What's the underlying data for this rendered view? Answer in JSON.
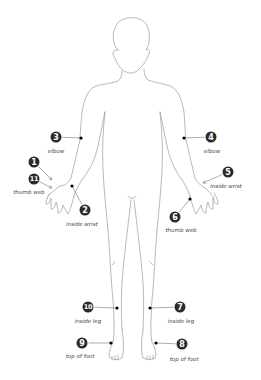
{
  "diagram": {
    "type": "body-outline-front",
    "colors": {
      "outline": "#9a9a9a",
      "marker_fill": "#2b2b2b",
      "marker_text": "#ffffff",
      "dot": "#000000",
      "label": "#444444"
    },
    "points": [
      {
        "id": "1",
        "number": "1",
        "label": "",
        "marker": [
          34,
          162
        ],
        "label_pos": [
          0,
          0
        ],
        "target": [
          52,
          180
        ],
        "connector": "arrow"
      },
      {
        "id": "11",
        "number": "11",
        "label": "thumb web",
        "marker": [
          34,
          179
        ],
        "label_pos": [
          29,
          192
        ],
        "target": [
          52,
          188
        ],
        "connector": "arrow"
      },
      {
        "id": "3",
        "number": "3",
        "label": "elbow",
        "marker": [
          56,
          137
        ],
        "label_pos": [
          56,
          151
        ],
        "target": [
          81,
          138
        ],
        "connector": "line"
      },
      {
        "id": "2",
        "number": "2",
        "label": "inside wrist",
        "marker": [
          85,
          210
        ],
        "label_pos": [
          82,
          224
        ],
        "target": [
          72,
          186
        ],
        "connector": "line"
      },
      {
        "id": "4",
        "number": "4",
        "label": "elbow",
        "marker": [
          211,
          137
        ],
        "label_pos": [
          212,
          151
        ],
        "target": [
          184,
          138
        ],
        "connector": "line"
      },
      {
        "id": "5",
        "number": "5",
        "label": "inside wrist",
        "marker": [
          228,
          172
        ],
        "label_pos": [
          226,
          186
        ],
        "target": [
          203,
          183
        ],
        "connector": "arrow"
      },
      {
        "id": "6",
        "number": "6",
        "label": "thumb web",
        "marker": [
          175,
          217
        ],
        "label_pos": [
          181,
          230
        ],
        "target": [
          190,
          199
        ],
        "connector": "line"
      },
      {
        "id": "10",
        "number": "10",
        "label": "inside leg",
        "marker": [
          88,
          307
        ],
        "label_pos": [
          88,
          321
        ],
        "target": [
          117,
          308
        ],
        "connector": "line"
      },
      {
        "id": "7",
        "number": "7",
        "label": "inside leg",
        "marker": [
          180,
          307
        ],
        "label_pos": [
          181,
          321
        ],
        "target": [
          150,
          308
        ],
        "connector": "line"
      },
      {
        "id": "9",
        "number": "9",
        "label": "top of foot",
        "marker": [
          82,
          343
        ],
        "label_pos": [
          80,
          356
        ],
        "target": [
          111,
          343
        ],
        "connector": "line"
      },
      {
        "id": "8",
        "number": "8",
        "label": "top of foot",
        "marker": [
          182,
          344
        ],
        "label_pos": [
          184,
          359
        ],
        "target": [
          156,
          343
        ],
        "connector": "line"
      }
    ]
  }
}
